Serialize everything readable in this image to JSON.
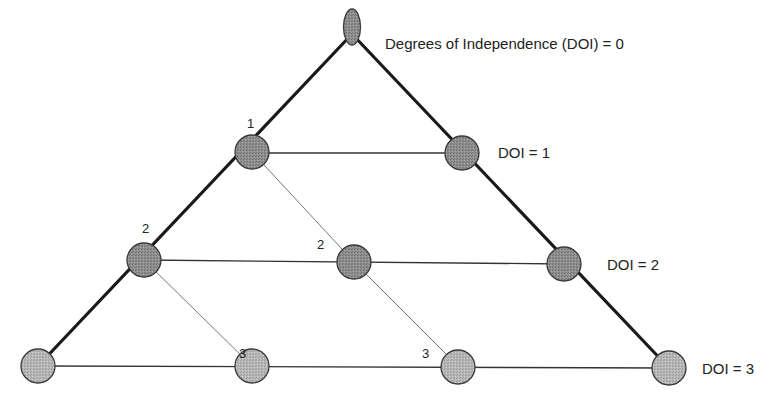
{
  "diagram": {
    "title_label": "Degrees of Independence (DOI) = 0",
    "level_labels": [
      {
        "text": "DOI = 1",
        "x": 498,
        "y": 158
      },
      {
        "text": "DOI = 2",
        "x": 607,
        "y": 270
      },
      {
        "text": "DOI = 3",
        "x": 702,
        "y": 374
      }
    ],
    "node_numbers": [
      {
        "text": "1",
        "x": 250,
        "y": 128
      },
      {
        "text": "2",
        "x": 146,
        "y": 232
      },
      {
        "text": "2",
        "x": 321,
        "y": 248
      },
      {
        "text": "3",
        "x": 243,
        "y": 355
      },
      {
        "text": "3",
        "x": 426,
        "y": 355
      }
    ],
    "colors": {
      "node_dark": "#8c8c8c",
      "node_light": "#b4b4b4",
      "node_stroke": "#3a3a3a",
      "edge_thick": "#1a1a1a",
      "edge_thin": "#333333",
      "edge_diag": "#777777"
    }
  }
}
